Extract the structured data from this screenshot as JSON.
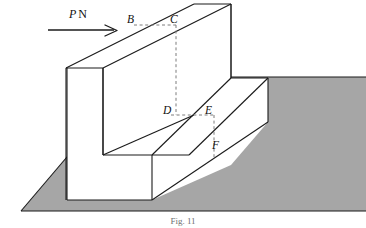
{
  "figure": {
    "caption": "Fig. 11",
    "background_color": "#ffffff",
    "ground": {
      "fill_color": "#a6a6a6",
      "stroke_color": "#1a1a1a"
    },
    "block": {
      "fill_color": "#ffffff",
      "stroke_color": "#1a1a1a",
      "description": "L-shaped stepped block"
    },
    "construction_lines": {
      "stroke_color": "#777777",
      "style": "dashed"
    }
  },
  "load": {
    "symbol": "P",
    "unit": "N",
    "arrow_direction": "right",
    "arrow_color": "#1a1a1a"
  },
  "labels": {
    "B": "B",
    "C": "C",
    "D": "D",
    "E": "E",
    "F": "F"
  }
}
